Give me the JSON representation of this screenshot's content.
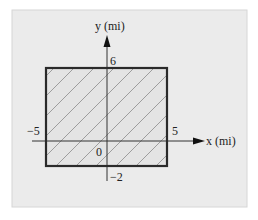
{
  "diagram": {
    "x_axis_label": "x (mi)",
    "y_axis_label": "y (mi)",
    "region": {
      "x_min": -5,
      "x_max": 5,
      "y_min": -2,
      "y_max": 6,
      "fill_pattern": "diagonal-hatch"
    },
    "ticks": {
      "x_min_label": "−5",
      "x_max_label": "5",
      "y_max_label": "6",
      "y_min_label": "−2",
      "origin_label": "0"
    },
    "colors": {
      "panel": "#ebebeb",
      "panel_border": "#d6d6d6",
      "region_fill": "#e4e4e4",
      "region_border": "#2a2a2a",
      "hatch": "#8a8a8a",
      "axis": "#333333"
    }
  }
}
